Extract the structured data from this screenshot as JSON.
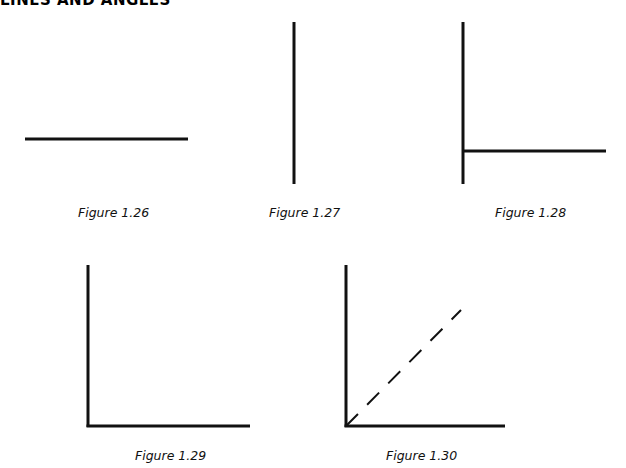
{
  "page": {
    "heading": "LINES AND ANGLES",
    "ink_color": "#111111"
  },
  "figures": [
    {
      "id": "fig-1-26",
      "caption": "Figure 1.26",
      "depicts": "horizontal line segment"
    },
    {
      "id": "fig-1-27",
      "caption": "Figure 1.27",
      "depicts": "vertical line segment"
    },
    {
      "id": "fig-1-28",
      "caption": "Figure 1.28",
      "depicts": "vertical line with horizontal line meeting it near the bottom"
    },
    {
      "id": "fig-1-29",
      "caption": "Figure 1.29",
      "depicts": "right angle formed by a vertical and horizontal ray"
    },
    {
      "id": "fig-1-30",
      "caption": "Figure 1.30",
      "depicts": "right angle with dashed bisector ray"
    }
  ]
}
